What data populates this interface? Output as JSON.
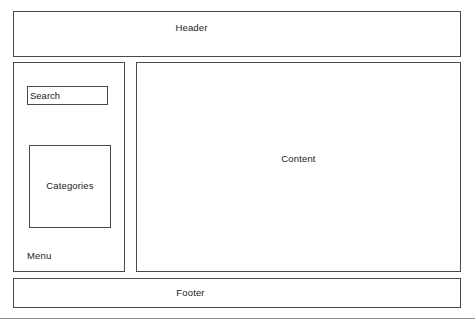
{
  "diagram": {
    "type": "webpage-layout-wireframe",
    "canvas": {
      "width": 475,
      "height": 326,
      "background": "#ffffff"
    },
    "stroke_color": "#4a4a4a",
    "text_color": "#1a1a1a"
  },
  "header": {
    "label": "Header"
  },
  "sidebar": {
    "search": {
      "value": "Search",
      "placeholder": "Search"
    },
    "categories": {
      "label": "Categories"
    },
    "menu": {
      "label": "Menu"
    }
  },
  "content": {
    "label": "Content"
  },
  "footer": {
    "label": "Footer"
  }
}
